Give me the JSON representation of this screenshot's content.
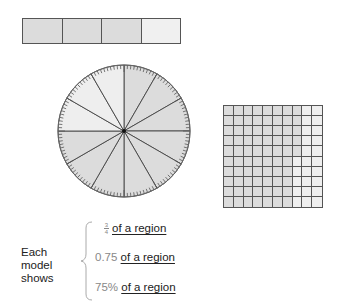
{
  "bar_model": {
    "segments": 4,
    "shaded": 3,
    "shaded_color": "#dcdcdc",
    "unshaded_color": "#f0f0f0"
  },
  "circle_model": {
    "sectors": 12,
    "shaded": 9,
    "shaded_color": "#dcdcdc",
    "unshaded_color": "#eeeeee"
  },
  "grid_model": {
    "rows": 10,
    "cols": 10,
    "shaded": 75,
    "shaded_color": "#dcdcdc",
    "unshaded_color": "#efefef"
  },
  "caption": {
    "label": "Each model shows",
    "rows": [
      {
        "value_num": "3",
        "value_den": "4",
        "text": "of a region"
      },
      {
        "value": "0.75",
        "text": "of a region"
      },
      {
        "value": "75%",
        "text": "of a region"
      }
    ]
  }
}
